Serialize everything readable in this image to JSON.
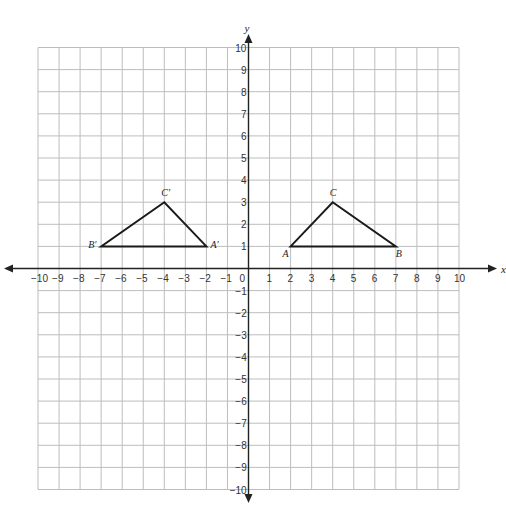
{
  "diagram": {
    "type": "coordinate-plane",
    "x_axis": {
      "label": "x",
      "min": -10,
      "max": 10,
      "ticks": [
        -10,
        -9,
        -8,
        -7,
        -6,
        -5,
        -4,
        -3,
        -2,
        -1,
        1,
        2,
        3,
        4,
        5,
        6,
        7,
        8,
        9,
        10
      ]
    },
    "y_axis": {
      "label": "y",
      "min": -10,
      "max": 10,
      "ticks": [
        -10,
        -9,
        -8,
        -7,
        -6,
        -5,
        -4,
        -3,
        -2,
        -1,
        1,
        2,
        3,
        4,
        5,
        6,
        7,
        8,
        9,
        10
      ]
    },
    "origin_label": "0",
    "grid": true,
    "colors": {
      "grid": "#bdbdbd",
      "axis": "#222222",
      "triangle": "#1a1a1a"
    },
    "triangles": [
      {
        "name": "ABC",
        "vertices": [
          {
            "label": "A",
            "x": 2,
            "y": 1
          },
          {
            "label": "B",
            "x": 7,
            "y": 1
          },
          {
            "label": "C",
            "x": 4,
            "y": 3
          }
        ]
      },
      {
        "name": "A'B'C'",
        "vertices": [
          {
            "label": "A′",
            "x": -2,
            "y": 1
          },
          {
            "label": "B′",
            "x": -7,
            "y": 1
          },
          {
            "label": "C′",
            "x": -4,
            "y": 3
          }
        ]
      }
    ]
  }
}
